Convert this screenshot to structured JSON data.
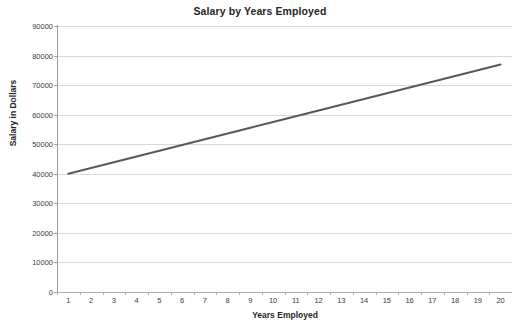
{
  "chart_data": {
    "type": "line",
    "title": "Salary by Years Employed",
    "xlabel": "Years Employed",
    "ylabel": "Salary in Dollars",
    "x": [
      1,
      2,
      3,
      4,
      5,
      6,
      7,
      8,
      9,
      10,
      11,
      12,
      13,
      14,
      15,
      16,
      17,
      18,
      19,
      20
    ],
    "values": [
      40000,
      41947,
      43895,
      45842,
      47789,
      49737,
      51684,
      53632,
      55579,
      57526,
      59474,
      61421,
      63368,
      65316,
      67263,
      69211,
      71158,
      73105,
      75053,
      77000
    ],
    "series": [
      {
        "name": "Salary",
        "color": "#595959",
        "values": [
          40000,
          41947,
          43895,
          45842,
          47789,
          49737,
          51684,
          53632,
          55579,
          57526,
          59474,
          61421,
          63368,
          65316,
          67263,
          69211,
          71158,
          73105,
          75053,
          77000
        ]
      }
    ],
    "xlim": [
      1,
      20
    ],
    "ylim": [
      0,
      90000
    ],
    "ytick_labels": [
      "0",
      "10000",
      "20000",
      "30000",
      "40000",
      "50000",
      "60000",
      "70000",
      "80000",
      "90000"
    ],
    "ytick_values": [
      0,
      10000,
      20000,
      30000,
      40000,
      50000,
      60000,
      70000,
      80000,
      90000
    ],
    "xtick_labels": [
      "1",
      "2",
      "3",
      "4",
      "5",
      "6",
      "7",
      "8",
      "9",
      "10",
      "11",
      "12",
      "13",
      "14",
      "15",
      "16",
      "17",
      "18",
      "19",
      "20"
    ],
    "grid": "horizontal",
    "legend": "none",
    "gridline_color": "#d9d9d9",
    "axis_color": "#9a9a9a",
    "background": "#ffffff"
  }
}
